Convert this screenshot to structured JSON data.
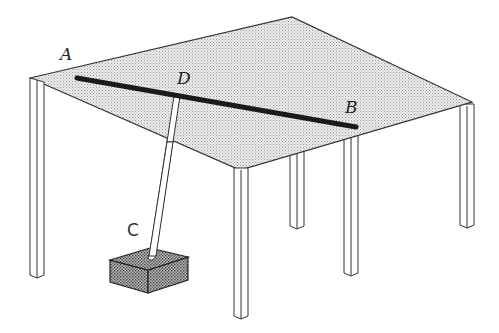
{
  "diagram": {
    "labels": {
      "A": "A",
      "B": "B",
      "C": "C",
      "D": "D"
    },
    "colors": {
      "stroke": "#333333",
      "tabletop_fill": "#dcdcdc",
      "rod": "#1a1a1a",
      "block_fill": "#8a8a8a",
      "background": "#ffffff"
    },
    "objects": [
      "table-top",
      "table-legs",
      "rod-AB",
      "strut-DC",
      "block"
    ]
  }
}
